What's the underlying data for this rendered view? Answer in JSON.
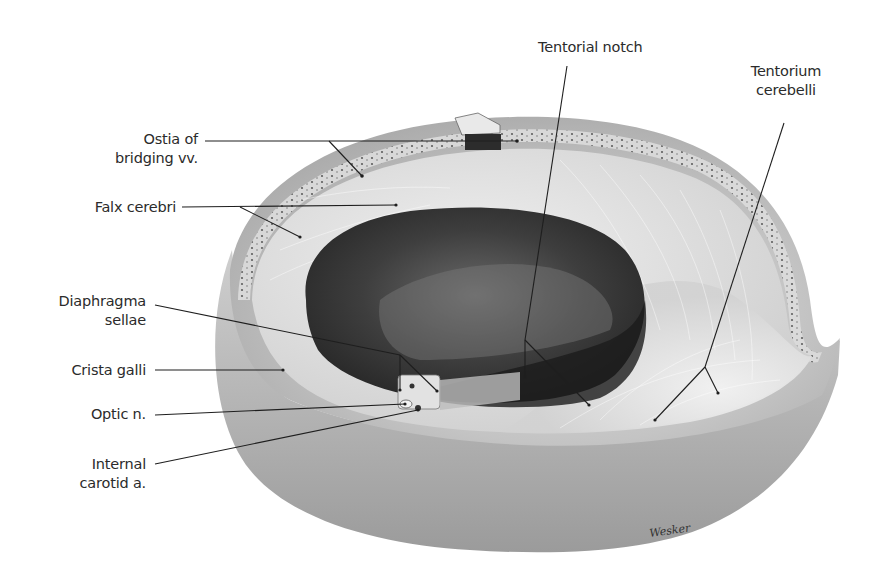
{
  "figure": {
    "background": "#ffffff",
    "label_color": "#2b2b2b",
    "leader_color": "#1e1e1e"
  },
  "labels": {
    "ostia": {
      "line1": "Ostia of",
      "line2": "bridging vv."
    },
    "falx": {
      "line1": "Falx cerebri"
    },
    "diaphragma": {
      "line1": "Diaphragma",
      "line2": "sellae"
    },
    "crista": {
      "line1": "Crista galli"
    },
    "optic": {
      "line1": "Optic n."
    },
    "carotid": {
      "line1": "Internal",
      "line2": "carotid a."
    },
    "notch": {
      "line1": "Tentorial notch"
    },
    "tentorium": {
      "line1": "Tentorium",
      "line2": "cerebelli"
    }
  },
  "signature": "Wesker"
}
